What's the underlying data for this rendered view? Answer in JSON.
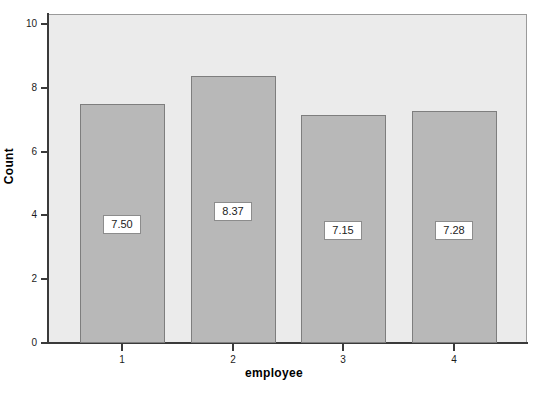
{
  "chart_data": {
    "type": "bar",
    "title": "",
    "subtitle": "",
    "xlabel": "employee",
    "ylabel": "Count",
    "categories": [
      "1",
      "2",
      "3",
      "4"
    ],
    "values": [
      7.5,
      8.37,
      7.15,
      7.28
    ],
    "data_labels": [
      "7.50",
      "8.37",
      "7.15",
      "7.28"
    ],
    "ylim": [
      0,
      10.3
    ],
    "ytick_labels": [
      "0",
      "2",
      "4",
      "6",
      "8",
      "10"
    ],
    "ytick_values": [
      0,
      2,
      4,
      6,
      8,
      10
    ],
    "xtick_labels": [
      "1",
      "2",
      "3",
      "4"
    ],
    "grid": false,
    "legend": "none",
    "bar_fill_color": "#b8b8b8",
    "bar_border_color": "#7e7e7e",
    "plot_background_color": "#ebebeb",
    "axis_color": "#3a3a3a",
    "label_box_background": "#ffffff",
    "label_box_border_color": "#8c8c8c"
  },
  "caption": ""
}
